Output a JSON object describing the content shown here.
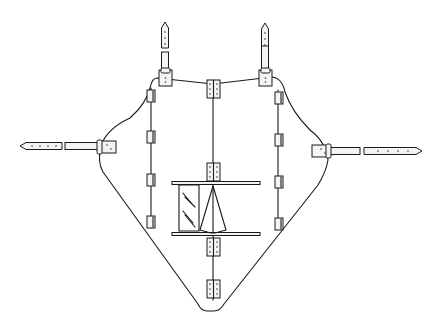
{
  "figure": {
    "type": "line-drawing",
    "background": "#ffffff",
    "ink": "#1a1a1a",
    "width": 442,
    "height": 314
  },
  "outline": {
    "path": "M 157 78 L 213 84 L 272 77 Q 282 78 285 92 Q 292 112 310 130 Q 326 142 328 160 Q 326 172 318 185 L 224 304 Q 220 311 214 311 L 207 311 Q 201 311 198 304 L 103 172 Q 97 162 101 145 Q 108 128 130 118 Q 146 104 150 88 Q 152 78 157 78 Z"
  },
  "vertical_lines": [
    {
      "x": 151,
      "y1": 88,
      "y2": 228
    },
    {
      "x": 213,
      "y1": 84,
      "y2": 300
    },
    {
      "x": 278,
      "y1": 90,
      "y2": 228
    }
  ],
  "small_hinges": [
    {
      "x": 147,
      "y": 90,
      "w": 8,
      "h": 12
    },
    {
      "x": 147,
      "y": 131,
      "w": 8,
      "h": 12
    },
    {
      "x": 147,
      "y": 174,
      "w": 8,
      "h": 12
    },
    {
      "x": 147,
      "y": 216,
      "w": 8,
      "h": 12
    },
    {
      "x": 275,
      "y": 92,
      "w": 8,
      "h": 12
    },
    {
      "x": 275,
      "y": 134,
      "w": 8,
      "h": 12
    },
    {
      "x": 275,
      "y": 176,
      "w": 8,
      "h": 12
    },
    {
      "x": 275,
      "y": 218,
      "w": 8,
      "h": 12
    }
  ],
  "central_hinges": [
    {
      "x": 207,
      "y": 80,
      "w": 13,
      "h": 18
    },
    {
      "x": 207,
      "y": 163,
      "w": 13,
      "h": 18
    },
    {
      "x": 207,
      "y": 238,
      "w": 13,
      "h": 18
    },
    {
      "x": 207,
      "y": 280,
      "w": 13,
      "h": 18
    }
  ],
  "shoulder_straps": [
    {
      "side": "left",
      "x": 165,
      "tip_y1": 22,
      "tip_y2": 48,
      "band_y1": 52,
      "band_y2": 70,
      "plate": {
        "x": 159,
        "y": 70,
        "w": 13,
        "h": 16
      }
    },
    {
      "side": "right",
      "x": 265,
      "tip_y1": 23,
      "tip_y2": 48,
      "band_y1": 46,
      "band_y2": 70,
      "plate": {
        "x": 259,
        "y": 70,
        "w": 13,
        "h": 16
      }
    }
  ],
  "side_straps": [
    {
      "side": "left",
      "y": 146,
      "tip_x1": 20,
      "tip_x2": 62,
      "band_x1": 65,
      "band_x2": 100,
      "plate": {
        "x": 98,
        "y": 141,
        "w": 18,
        "h": 12
      }
    },
    {
      "side": "right",
      "y": 151,
      "tip_x1": 364,
      "tip_x2": 422,
      "band_x1": 328,
      "band_x2": 360,
      "plate": {
        "x": 312,
        "y": 145,
        "w": 18,
        "h": 12
      }
    }
  ],
  "mirror_unit": {
    "bars": [
      {
        "x1": 172,
        "x2": 260,
        "y": 183
      },
      {
        "x1": 172,
        "x2": 260,
        "y": 234
      }
    ],
    "mirror": {
      "x": 179,
      "y": 185,
      "w": 20,
      "h": 46
    },
    "cone": {
      "apex_x": 213,
      "apex_y": 186,
      "base_x1": 200,
      "base_x2": 226,
      "base_y": 230
    }
  }
}
